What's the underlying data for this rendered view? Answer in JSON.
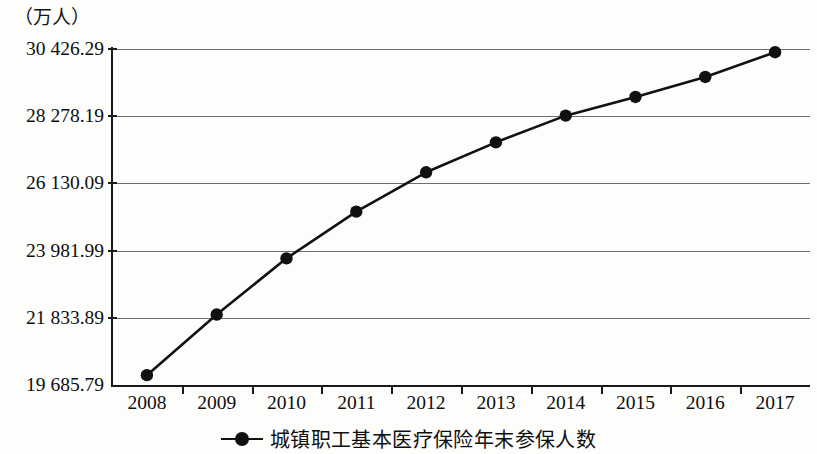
{
  "chart_data": {
    "type": "line",
    "title": "",
    "unit_label": "（万人）",
    "xlabel": "",
    "ylabel": "",
    "grid": true,
    "legend_position": "bottom-center",
    "x": [
      "2008",
      "2009",
      "2010",
      "2011",
      "2012",
      "2013",
      "2014",
      "2015",
      "2016",
      "2017"
    ],
    "categories": [
      "2008",
      "2009",
      "2010",
      "2011",
      "2012",
      "2013",
      "2014",
      "2015",
      "2016",
      "2017"
    ],
    "ylim": [
      19685.79,
      30426.29
    ],
    "ytick_values": [
      30426.29,
      28278.19,
      26130.09,
      23981.99,
      21833.89,
      19685.79
    ],
    "ytick_labels": [
      "30 426.29",
      "28 278.19",
      "26 130.09",
      "23 981.99",
      "21 833.89",
      "19 685.79"
    ],
    "series": [
      {
        "name": "城镇职工基本医疗保险年末参保人数",
        "color": "#111111",
        "marker": "circle",
        "values": [
          20000.0,
          21937.65,
          23734.67,
          25227.11,
          26485.74,
          27442.99,
          28296.22,
          28892.87,
          29532.36,
          30322.82
        ]
      }
    ],
    "legend": [
      "城镇职工基本医疗保险年末参保人数"
    ]
  },
  "axis": {
    "y_unit": "（万人）"
  },
  "legend": {
    "entry_label": "城镇职工基本医疗保险年末参保人数"
  }
}
